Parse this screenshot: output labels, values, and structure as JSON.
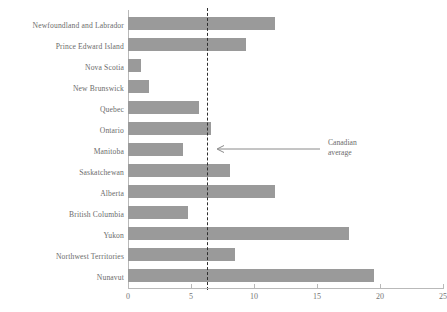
{
  "chart_data": {
    "type": "bar",
    "orientation": "horizontal",
    "title": "",
    "xlabel": "",
    "ylabel": "",
    "xlim": [
      0,
      25
    ],
    "xticks": [
      0,
      5,
      10,
      15,
      20,
      25
    ],
    "xtick_labels": [
      "0",
      "5",
      "10",
      "15",
      "20",
      "25"
    ],
    "grid": false,
    "legend": false,
    "bar_color": "#9a9a9a",
    "categories": [
      "Newfoundland and Labrador",
      "Prince Edward Island",
      "Nova Scotia",
      "New Brunswick",
      "Quebec",
      "Ontario",
      "Manitoba",
      "Saskatchewan",
      "Alberta",
      "British Columbia",
      "Yukon",
      "Northwest Territories",
      "Nunavut"
    ],
    "values": [
      11.7,
      9.4,
      1.0,
      1.7,
      5.6,
      6.6,
      4.4,
      8.1,
      11.7,
      4.8,
      17.5,
      8.5,
      19.5
    ],
    "reference_line": {
      "value": 6.3,
      "style": "dashed",
      "color": "#2f2f2f",
      "label_line1": "Canadian",
      "label_line2": "average"
    }
  }
}
